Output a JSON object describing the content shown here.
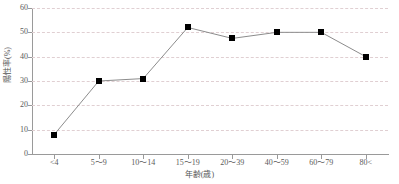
{
  "chart_data": {
    "type": "line",
    "title": "",
    "subtitle": "",
    "xlabel": "年齢(歳)",
    "ylabel": "陽性率(%)",
    "categories": [
      "<4",
      "5～9",
      "10～14",
      "15～19",
      "20～39",
      "40～59",
      "60～79",
      "80<"
    ],
    "values": [
      8,
      30,
      31,
      52,
      47.5,
      50,
      50,
      40
    ],
    "series": [
      {
        "name": "陽性率",
        "values": [
          8,
          30,
          31,
          52,
          47.5,
          50,
          50,
          40
        ]
      }
    ],
    "ylim": [
      0,
      60
    ],
    "yticks": [
      0,
      10,
      20,
      30,
      40,
      50,
      60
    ],
    "ytick_labels": [
      "0",
      "10",
      "20",
      "30",
      "40",
      "50",
      "60"
    ],
    "grid": "horizontal-dashed",
    "legend": "none",
    "marker": "filled-square",
    "marker_color": "#000000",
    "line_color": "#8c8c8c",
    "gridline_color": "#e0cfd2",
    "axis_color": "#9a9a9a"
  }
}
